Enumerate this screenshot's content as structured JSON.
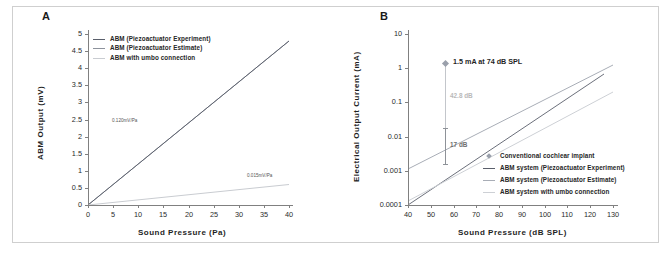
{
  "figure": {
    "background_color": "#ffffff",
    "frame_color": "#cfcfcf"
  },
  "panel_a": {
    "letter": "A",
    "chart_data": {
      "type": "line",
      "title": "",
      "xlabel": "Sound Pressure (Pa)",
      "ylabel": "ABM Output  (mV)",
      "xlim": [
        0,
        40
      ],
      "ylim": [
        0,
        5
      ],
      "xticks": [
        "0",
        "5",
        "10",
        "15",
        "20",
        "25",
        "30",
        "35",
        "40"
      ],
      "yticks": [
        "0",
        "0.5",
        "1",
        "1.5",
        "2",
        "2.5",
        "3",
        "3.5",
        "4",
        "4.5",
        "5"
      ],
      "grid": false,
      "legend_position": "top-left-inside",
      "series": [
        {
          "name": "ABM (Piezoactuator Experiment)",
          "color": "#5a5f6b",
          "slope_mv_per_pa": 0.12,
          "x": [
            0,
            40
          ],
          "values": [
            0,
            4.8
          ]
        },
        {
          "name": "ABM (Piezoactuator Estimate)",
          "color": "#8d929c",
          "slope_mv_per_pa": 0.12,
          "x": [
            0,
            40
          ],
          "values": [
            0,
            4.8
          ]
        },
        {
          "name": "ABM with umbo connection",
          "color": "#c9ccd1",
          "slope_mv_per_pa": 0.015,
          "x": [
            0,
            40
          ],
          "values": [
            0,
            0.6
          ]
        }
      ],
      "annotations": [
        {
          "text": "0.120mV/Pa",
          "x": 15.5,
          "y": 2.35
        },
        {
          "text": "0.015mV/Pa",
          "x": 33.0,
          "y": 0.78
        }
      ]
    }
  },
  "panel_b": {
    "letter": "B",
    "chart_data": {
      "type": "line",
      "title": "",
      "xlabel": "Sound Pressure (dB SPL)",
      "ylabel": "Electrical  Output  Current (mA)",
      "xlim": [
        40,
        130
      ],
      "ylim": [
        0.0001,
        10
      ],
      "yscale": "log",
      "xticks": [
        "40",
        "50",
        "60",
        "70",
        "80",
        "90",
        "100",
        "110",
        "120",
        "130"
      ],
      "yticks": [
        "0.0001",
        "0.001",
        "0.01",
        "0.1",
        "1",
        "10"
      ],
      "grid": false,
      "legend_position": "bottom-right-inside",
      "series": [
        {
          "name": "Conventional cochlear implant",
          "type": "scatter",
          "color": "#9aa0ab",
          "x": [
            74
          ],
          "values": [
            1.5
          ]
        },
        {
          "name": "ABM system (Piezoactuator Experiment)",
          "color": "#5a5f6b",
          "x": [
            40,
            126
          ],
          "values": [
            1.9e-06,
            2.4
          ]
        },
        {
          "name": "ABM system (Piezoactuator Estimate)",
          "color": "#a8adb6",
          "x": [
            40,
            130
          ],
          "values": [
            3e-05,
            3.3
          ]
        },
        {
          "name": "ABM system with umbo connection",
          "color": "#cdd0d5",
          "x": [
            40,
            130
          ],
          "values": [
            3.8e-06,
            0.42
          ]
        }
      ],
      "annotations": [
        {
          "text": "1.5 mA at 74 dB SPL",
          "x": 76,
          "y": 1.5,
          "style": "bold"
        },
        {
          "text": "42.8 dB",
          "x": 75,
          "y": 0.1,
          "style": "light-gray"
        },
        {
          "text": "17 dB",
          "x": 75,
          "y": 0.004,
          "style": "dark-gray"
        }
      ],
      "marker": {
        "name": "conventional-cochlear-implant-point",
        "x": 74,
        "y": 1.5,
        "label": "1.5 mA at 74 dB SPL"
      }
    }
  }
}
